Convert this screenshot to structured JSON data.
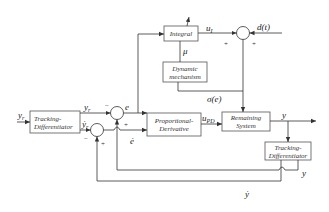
{
  "diagram": {
    "type": "control-block-diagram",
    "blocks": {
      "integral": {
        "label": "Integral"
      },
      "dynamic": {
        "line1": "Dynamic",
        "line2": "mechanism"
      },
      "td_left": {
        "line1": "Tracking-",
        "line2": "Differentiator"
      },
      "pd": {
        "line1": "Proportional-",
        "line2": "Derivative"
      },
      "remaining": {
        "line1": "Remaining",
        "line2": "System"
      },
      "td_right": {
        "line1": "Tracking-",
        "line2": "Differentiator"
      }
    },
    "signals": {
      "input": "y_r",
      "yr": "y_r",
      "yr_dot": "ẏ_r",
      "e": "e",
      "e_dot": "ė",
      "u_i": "u_I",
      "mu": "μ",
      "sigma": "σ(e)",
      "d": "d(t)",
      "u_pd": "u_PD",
      "y": "y",
      "y_fb": "y",
      "y_dot": "ẏ"
    },
    "signs": {
      "sum_top_left": "+",
      "sum_top_right": "+",
      "sum_e_minus": "−",
      "sum_e_plus": "+",
      "sum_edot_minus": "−",
      "sum_edot_plus": "+"
    }
  }
}
